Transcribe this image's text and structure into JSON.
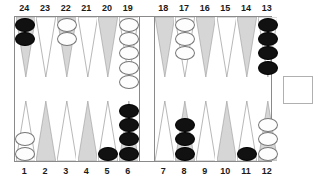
{
  "board": {
    "title": "Backgammon Board",
    "colors": {
      "point_light": "#d6d6d6",
      "point_outline": "#9a9a9a",
      "checker_black": "#111111",
      "checker_white": "#fdfdfd",
      "frame": "#8a8a8a",
      "label": "#1a1a1a",
      "background": "#ffffff"
    },
    "top_labels": [
      "24",
      "23",
      "22",
      "21",
      "20",
      "19",
      "18",
      "17",
      "16",
      "15",
      "14",
      "13"
    ],
    "bottom_labels": [
      "1",
      "2",
      "3",
      "4",
      "5",
      "6",
      "7",
      "8",
      "9",
      "10",
      "11",
      "12"
    ],
    "points": [
      {
        "label": "24",
        "row": "top",
        "slot": 0,
        "shade": "light",
        "checkers": 2,
        "color": "black"
      },
      {
        "label": "23",
        "row": "top",
        "slot": 1,
        "shade": "outline",
        "checkers": 0,
        "color": "none"
      },
      {
        "label": "22",
        "row": "top",
        "slot": 2,
        "shade": "light",
        "checkers": 2,
        "color": "white"
      },
      {
        "label": "21",
        "row": "top",
        "slot": 3,
        "shade": "outline",
        "checkers": 0,
        "color": "none"
      },
      {
        "label": "20",
        "row": "top",
        "slot": 4,
        "shade": "light",
        "checkers": 0,
        "color": "none"
      },
      {
        "label": "19",
        "row": "top",
        "slot": 5,
        "shade": "outline",
        "checkers": 5,
        "color": "white"
      },
      {
        "label": "18",
        "row": "top",
        "slot": 6,
        "shade": "light",
        "checkers": 0,
        "color": "none"
      },
      {
        "label": "17",
        "row": "top",
        "slot": 7,
        "shade": "outline",
        "checkers": 3,
        "color": "white"
      },
      {
        "label": "16",
        "row": "top",
        "slot": 8,
        "shade": "light",
        "checkers": 0,
        "color": "none"
      },
      {
        "label": "15",
        "row": "top",
        "slot": 9,
        "shade": "outline",
        "checkers": 0,
        "color": "none"
      },
      {
        "label": "14",
        "row": "top",
        "slot": 10,
        "shade": "light",
        "checkers": 0,
        "color": "none"
      },
      {
        "label": "13",
        "row": "top",
        "slot": 11,
        "shade": "outline",
        "checkers": 4,
        "color": "black"
      },
      {
        "label": "1",
        "row": "bottom",
        "slot": 0,
        "shade": "outline",
        "checkers": 2,
        "color": "white"
      },
      {
        "label": "2",
        "row": "bottom",
        "slot": 1,
        "shade": "light",
        "checkers": 0,
        "color": "none"
      },
      {
        "label": "3",
        "row": "bottom",
        "slot": 2,
        "shade": "outline",
        "checkers": 0,
        "color": "none"
      },
      {
        "label": "4",
        "row": "bottom",
        "slot": 3,
        "shade": "light",
        "checkers": 0,
        "color": "none"
      },
      {
        "label": "5",
        "row": "bottom",
        "slot": 4,
        "shade": "outline",
        "checkers": 1,
        "color": "black"
      },
      {
        "label": "6",
        "row": "bottom",
        "slot": 5,
        "shade": "light",
        "checkers": 4,
        "color": "black"
      },
      {
        "label": "7",
        "row": "bottom",
        "slot": 6,
        "shade": "outline",
        "checkers": 0,
        "color": "none"
      },
      {
        "label": "8",
        "row": "bottom",
        "slot": 7,
        "shade": "light",
        "checkers": 3,
        "color": "black"
      },
      {
        "label": "9",
        "row": "bottom",
        "slot": 8,
        "shade": "outline",
        "checkers": 0,
        "color": "none"
      },
      {
        "label": "10",
        "row": "bottom",
        "slot": 9,
        "shade": "light",
        "checkers": 0,
        "color": "none"
      },
      {
        "label": "11",
        "row": "bottom",
        "slot": 10,
        "shade": "outline",
        "checkers": 1,
        "color": "black"
      },
      {
        "label": "12",
        "row": "bottom",
        "slot": 11,
        "shade": "light",
        "checkers": 3,
        "color": "white"
      }
    ],
    "bar": {
      "black": 0,
      "white": 0
    },
    "tray": {
      "label": "",
      "checkers": 0
    }
  }
}
